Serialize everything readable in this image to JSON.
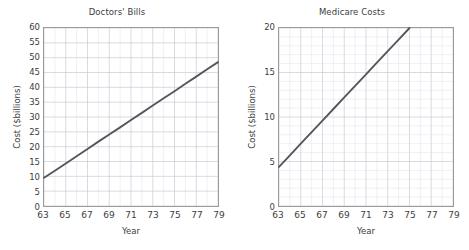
{
  "page": {
    "background_color": "#ffffff",
    "line_color": "#55565a",
    "grid_color": "#c9cbd4",
    "minor_grid_color": "#dfe1e8",
    "frame_color": "#9a9a9a",
    "text_color": "#3d3d3d"
  },
  "charts": [
    {
      "id": "doctors-bills",
      "title": "Doctors' Bills",
      "xlabel": "Year",
      "ylabel": "Cost ($billions)",
      "type": "line",
      "xlim": [
        63,
        79
      ],
      "ylim": [
        0,
        60
      ],
      "x_ticks": [
        63,
        65,
        67,
        69,
        71,
        73,
        75,
        77,
        79
      ],
      "x_tick_labels": [
        "63",
        "65",
        "67",
        "69",
        "71",
        "73",
        "75",
        "77",
        "79"
      ],
      "y_ticks": [
        0,
        5,
        10,
        15,
        20,
        25,
        30,
        35,
        40,
        45,
        50,
        55,
        60
      ],
      "y_tick_labels": [
        "0",
        "5",
        "10",
        "15",
        "20",
        "25",
        "30",
        "35",
        "40",
        "45",
        "50",
        "55",
        "60"
      ],
      "x_minor_step": 1,
      "y_minor_step": 5,
      "grid": true,
      "legend": "none",
      "series": [
        {
          "name": "Doctors' Bills",
          "x": [
            63,
            79
          ],
          "values": [
            9.5,
            48.5
          ],
          "points": [
            [
              63,
              9.5
            ],
            [
              64,
              11.9
            ],
            [
              65,
              14.3
            ],
            [
              66,
              16.8
            ],
            [
              67,
              19.2
            ],
            [
              68,
              21.7
            ],
            [
              69,
              24.1
            ],
            [
              70,
              26.5
            ],
            [
              71,
              29.0
            ],
            [
              72,
              31.4
            ],
            [
              73,
              33.9
            ],
            [
              74,
              36.3
            ],
            [
              75,
              38.7
            ],
            [
              76,
              41.2
            ],
            [
              77,
              43.6
            ],
            [
              78,
              46.1
            ],
            [
              79,
              48.5
            ]
          ]
        }
      ]
    },
    {
      "id": "medicare-costs",
      "title": "Medicare Costs",
      "xlabel": "Year",
      "ylabel": "Cost ($billions)",
      "type": "line",
      "xlim": [
        63,
        79
      ],
      "ylim": [
        0,
        20
      ],
      "x_ticks": [
        63,
        65,
        67,
        69,
        71,
        73,
        75,
        77,
        79
      ],
      "x_tick_labels": [
        "63",
        "65",
        "67",
        "69",
        "71",
        "73",
        "75",
        "77",
        "79"
      ],
      "y_ticks": [
        0,
        5,
        10,
        15,
        20
      ],
      "y_tick_labels": [
        "0",
        "5",
        "10",
        "15",
        "20"
      ],
      "x_minor_step": 1,
      "y_minor_step": 1,
      "grid": true,
      "legend": "none",
      "series": [
        {
          "name": "Medicare Costs",
          "x": [
            63,
            75
          ],
          "values": [
            4.4,
            20.0
          ],
          "points": [
            [
              63,
              4.4
            ],
            [
              64,
              5.7
            ],
            [
              65,
              7.0
            ],
            [
              66,
              8.3
            ],
            [
              67,
              9.6
            ],
            [
              68,
              10.9
            ],
            [
              69,
              12.2
            ],
            [
              70,
              13.5
            ],
            [
              71,
              14.8
            ],
            [
              72,
              16.1
            ],
            [
              73,
              17.4
            ],
            [
              74,
              18.7
            ],
            [
              75,
              20.0
            ]
          ]
        }
      ]
    }
  ],
  "chart_data": {
    "type": "line",
    "charts": [
      {
        "title": "Doctors' Bills",
        "xlabel": "Year",
        "ylabel": "Cost ($billions)",
        "xlim": [
          63,
          79
        ],
        "ylim": [
          0,
          60
        ],
        "x": [
          63,
          65,
          67,
          69,
          71,
          73,
          75,
          77,
          79
        ],
        "values": [
          9.5,
          14.3,
          19.2,
          24.1,
          29.0,
          33.9,
          38.7,
          43.6,
          48.5
        ],
        "grid": true,
        "legend": "none"
      },
      {
        "title": "Medicare Costs",
        "xlabel": "Year",
        "ylabel": "Cost ($billions)",
        "xlim": [
          63,
          79
        ],
        "ylim": [
          0,
          20
        ],
        "x": [
          63,
          65,
          67,
          69,
          71,
          73,
          75
        ],
        "values": [
          4.4,
          7.0,
          9.6,
          12.2,
          14.8,
          17.4,
          20.0
        ],
        "grid": true,
        "legend": "none"
      }
    ]
  }
}
